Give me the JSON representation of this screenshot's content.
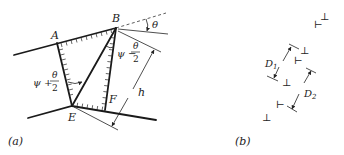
{
  "figure": {
    "panel_a": {
      "label": "(a)",
      "points": {
        "A": "A",
        "B": "B",
        "E": "E",
        "F": "F"
      },
      "angle_labels": {
        "theta": "θ",
        "psi_minus": "ψ −",
        "psi_plus": "ψ +",
        "frac_num": "θ",
        "frac_den": "2"
      },
      "dimension": "h"
    },
    "panel_b": {
      "label": "(b)",
      "dimensions": {
        "d1": "D",
        "d1_sub": "1",
        "d2": "D",
        "d2_sub": "2"
      },
      "symbols": {
        "up": "⊥",
        "side": "⊢"
      }
    }
  }
}
